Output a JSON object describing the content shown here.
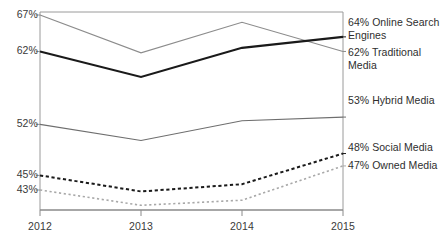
{
  "chart_data": {
    "type": "line",
    "title": "",
    "xlabel": "",
    "ylabel": "",
    "categories": [
      "2012",
      "2013",
      "2014",
      "2015"
    ],
    "x": [
      2012,
      2013,
      2014,
      2015
    ],
    "ylim": [
      40,
      68
    ],
    "grid": false,
    "legend_position": "right-inline-end-labels",
    "y_tick_labels": [
      "67%",
      "62%",
      "52%",
      "45%",
      "43%"
    ],
    "y_tick_values": [
      67,
      62,
      52,
      45,
      43
    ],
    "series": [
      {
        "name": "Online Search Engines",
        "end_label": "64% Online Search\nEngines",
        "end_value": 64,
        "values": [
          67,
          61.8,
          66,
          62
        ],
        "color": "#8c8c8c",
        "style": "solid",
        "width": 1.2
      },
      {
        "name": "Traditional Media",
        "end_label": "62% Traditional\nMedia",
        "end_value": 62,
        "values": [
          62,
          58.5,
          62.5,
          64
        ],
        "color": "#1a1a1a",
        "style": "solid",
        "width": 2.2
      },
      {
        "name": "Hybrid Media",
        "end_label": "53% Hybrid Media",
        "end_value": 53,
        "values": [
          52,
          49.8,
          52.5,
          53
        ],
        "color": "#6e6e6e",
        "style": "solid",
        "width": 1.1
      },
      {
        "name": "Social Media",
        "end_label": "48% Social Media",
        "end_value": 48,
        "values": [
          45,
          42.8,
          43.8,
          48
        ],
        "color": "#1a1a1a",
        "style": "dashed",
        "width": 2.0
      },
      {
        "name": "Owned Media",
        "end_label": "47% Owned Media",
        "end_value": 47,
        "values": [
          43,
          40.9,
          41.6,
          46.3
        ],
        "color": "#a8a8a8",
        "style": "dotted",
        "width": 1.6
      }
    ]
  },
  "axes": {
    "y_ticks": [
      {
        "label": "67%",
        "value": 67
      },
      {
        "label": "62%",
        "value": 62
      },
      {
        "label": "52%",
        "value": 52
      },
      {
        "label": "45%",
        "value": 45
      },
      {
        "label": "43%",
        "value": 43
      }
    ],
    "x_ticks": [
      {
        "label": "2012",
        "value": 2012
      },
      {
        "label": "2013",
        "value": 2013
      },
      {
        "label": "2014",
        "value": 2014
      },
      {
        "label": "2015",
        "value": 2015
      }
    ],
    "axis_color": "#8a8a8a"
  }
}
